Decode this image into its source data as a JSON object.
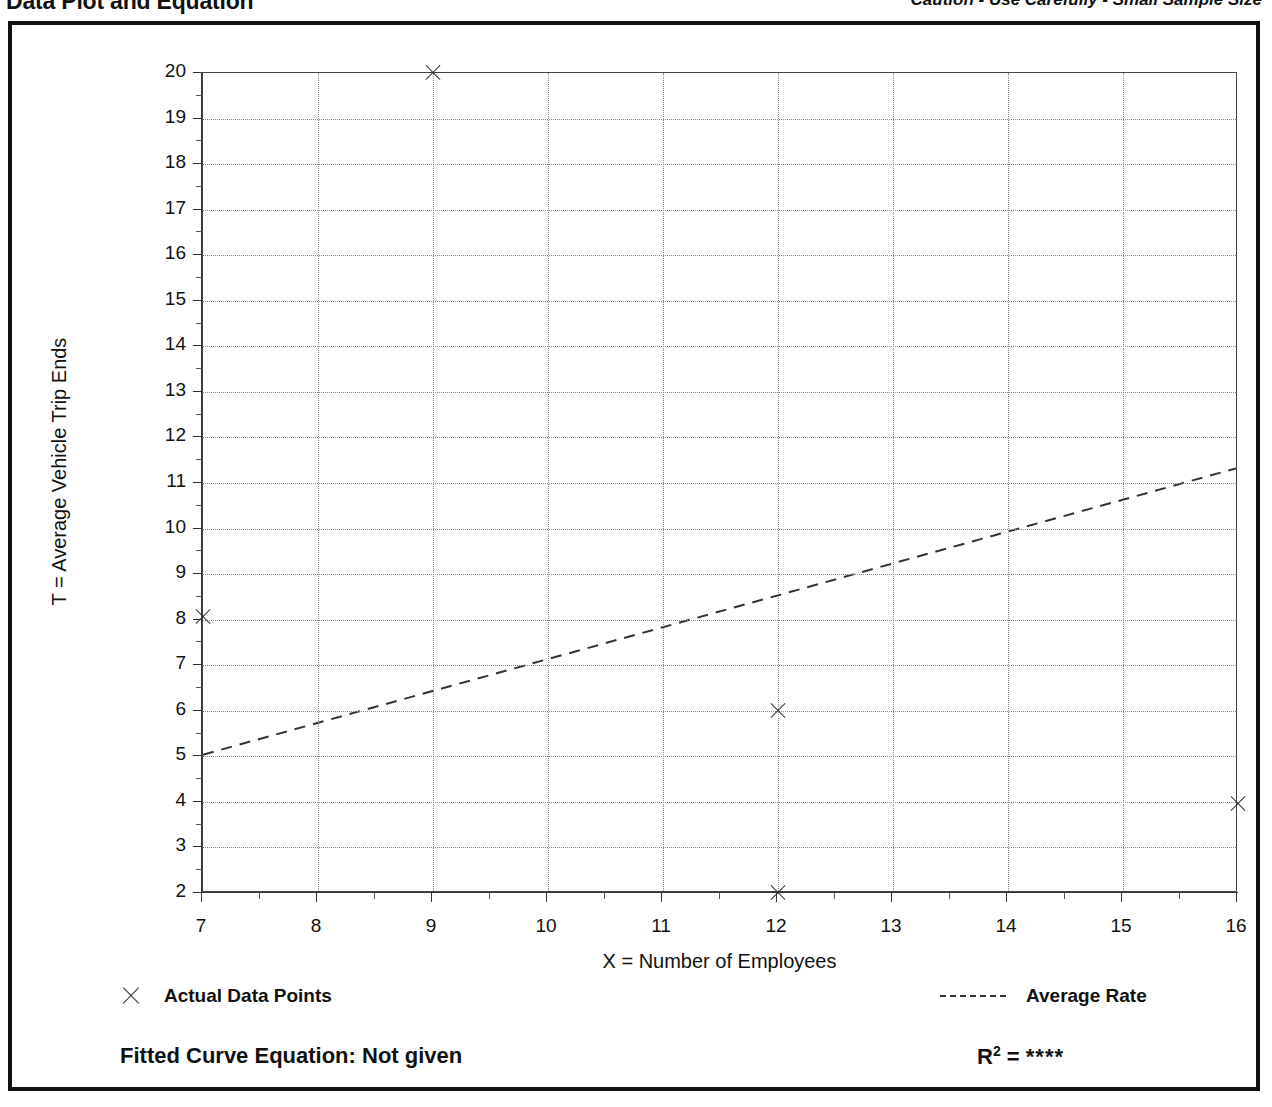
{
  "header": {
    "title": "Data Plot and Equation",
    "caution": "Caution - Use Carefully - Small Sample Size"
  },
  "legend": {
    "data_points_label": "Actual Data Points",
    "average_rate_label": "Average Rate",
    "marker_icon": "x-marker-icon",
    "line_icon": "dashed-line-icon"
  },
  "footer": {
    "fitted_equation": "Fitted Curve Equation:  Not given",
    "r2_label": "R",
    "r2_exponent": "2",
    "r2_equals": " = ",
    "r2_value": "****"
  },
  "chart_data": {
    "type": "scatter",
    "title": "Data Plot and Equation",
    "xlabel": "X = Number of Employees",
    "ylabel": "T = Average Vehicle Trip Ends",
    "xlim": [
      7,
      16
    ],
    "ylim": [
      2,
      20
    ],
    "xticks": [
      7,
      8,
      9,
      10,
      11,
      12,
      13,
      14,
      15,
      16
    ],
    "yticks": [
      2,
      3,
      4,
      5,
      6,
      7,
      8,
      9,
      10,
      11,
      12,
      13,
      14,
      15,
      16,
      17,
      18,
      19,
      20
    ],
    "x_minor_step": 0.5,
    "y_minor_step": 0.5,
    "grid": true,
    "legend_position": "below-axes",
    "series": [
      {
        "name": "Actual Data Points",
        "type": "scatter",
        "marker": "x",
        "points": [
          {
            "x": 7,
            "y": 8.05
          },
          {
            "x": 9,
            "y": 20.0
          },
          {
            "x": 12,
            "y": 6.0
          },
          {
            "x": 12,
            "y": 2.0
          },
          {
            "x": 16,
            "y": 3.95
          }
        ]
      },
      {
        "name": "Average Rate",
        "type": "line",
        "style": "dashed",
        "points": [
          {
            "x": 7,
            "y": 5.0
          },
          {
            "x": 16,
            "y": 11.3
          }
        ]
      }
    ]
  }
}
